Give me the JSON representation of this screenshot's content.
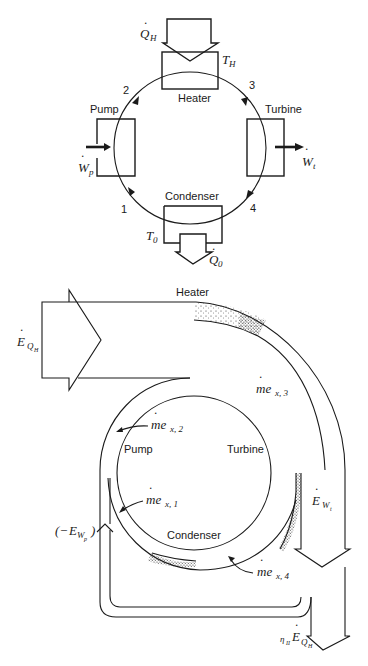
{
  "header_fragment": "",
  "top_diagram": {
    "components": {
      "heater": "Heater",
      "pump": "Pump",
      "turbine": "Turbine",
      "condenser": "Condenser"
    },
    "state_points": [
      "1",
      "2",
      "3",
      "4"
    ],
    "labels": {
      "heat_in": {
        "main": "Q",
        "sub": "H"
      },
      "hot_temp": {
        "main": "T",
        "sub": "H"
      },
      "heat_out": {
        "main": "Q",
        "sub": "0"
      },
      "cold_temp": {
        "main": "T",
        "sub": "0"
      },
      "pump_work": {
        "main": "W",
        "sub": "p"
      },
      "turbine_work": {
        "main": "W",
        "sub": "t"
      }
    }
  },
  "bottom_diagram": {
    "components": {
      "heater": "Heater",
      "pump": "Pump",
      "turbine": "Turbine",
      "condenser": "Condenser"
    },
    "labels": {
      "exergy_heat_in": {
        "main": "E",
        "sub": "Q",
        "subsub": "H"
      },
      "flow_1": {
        "main": "me",
        "sub": "x, 1"
      },
      "flow_2": {
        "main": "me",
        "sub": "x, 2"
      },
      "flow_3": {
        "main": "me",
        "sub": "x, 3"
      },
      "flow_4": {
        "main": "me",
        "sub": "x, 4"
      },
      "turbine_exergy": {
        "main": "E",
        "sub": "W",
        "subsub": "t"
      },
      "pump_exergy": {
        "prefix": "(−",
        "main": "E",
        "sub": "W",
        "subsub": "p",
        "suffix": ")"
      },
      "net_output": {
        "eta": "η",
        "eta_sub": "II",
        "main": "E",
        "sub": "Q",
        "subsub": "H"
      }
    }
  }
}
